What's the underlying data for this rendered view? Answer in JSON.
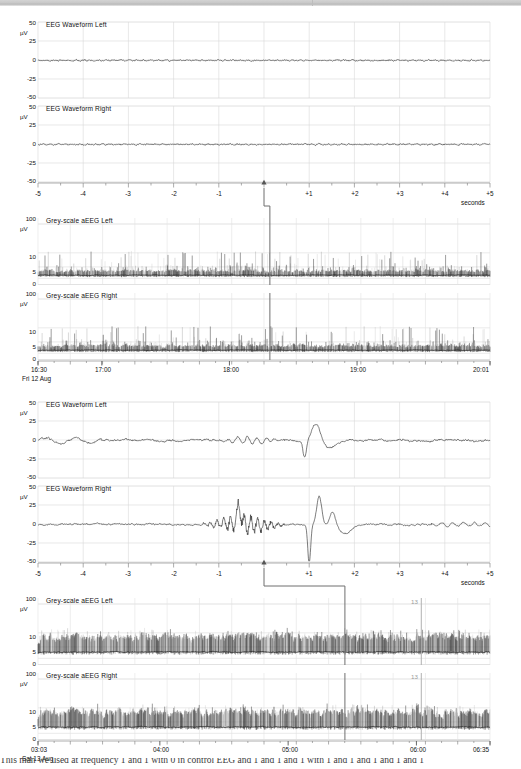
{
  "meta": {
    "units_label": "µV",
    "seconds_label": "seconds",
    "grid_color": "#d8d8d8",
    "axis_color": "#8a8a8a",
    "trace_color": "#2b2b2b",
    "marker_color": "#6e6e6e",
    "annotation_color": "#9b9b9b"
  },
  "caption": {
    "text": "This man we used at frequency 1 and 1 with 0 in control EEG and 1 and 1 and 1 with 1 and 1 and 1 and 1 and 1"
  },
  "panels": [
    {
      "id": "panel-top",
      "eeg": [
        {
          "title": "EEG Waveform Left",
          "y_ticks": [
            "50",
            "25",
            "0",
            "-25",
            "-50"
          ],
          "y_values": [
            50,
            25,
            0,
            -25,
            -50
          ],
          "unit": "µV"
        },
        {
          "title": "EEG Waveform Right",
          "y_ticks": [
            "50",
            "25",
            "0",
            "-25",
            "-50"
          ],
          "y_values": [
            50,
            25,
            0,
            -25,
            -50
          ],
          "unit": "µV"
        }
      ],
      "eeg_x_ticks": [
        "-5",
        "-4",
        "-3",
        "-2",
        "-1",
        "",
        "+1",
        "+2",
        "+3",
        "+4",
        "+5"
      ],
      "eeg_x_unit": "seconds",
      "eeg_marker_seconds": 0,
      "aeeg": [
        {
          "title": "Grey-scale aEEG Left",
          "y_ticks": [
            "100",
            "10",
            "5",
            "0"
          ],
          "unit": "µV"
        },
        {
          "title": "Grey-scale aEEG Right",
          "y_ticks": [
            "100",
            "10",
            "5",
            "0"
          ],
          "unit": "µV"
        }
      ],
      "aeeg_x_ticks": [
        "16:30",
        "17:00",
        "18:00",
        "19:00",
        "20:01"
      ],
      "aeeg_x_positions": [
        0.0,
        0.1412,
        0.4235,
        0.7059,
        1.0
      ],
      "aeeg_date": "Fri 12 Aug",
      "aeeg_cursor_fraction": 0.513,
      "aeeg_annotations": []
    },
    {
      "id": "panel-bottom",
      "eeg": [
        {
          "title": "EEG Waveform Left",
          "y_ticks": [
            "50",
            "25",
            "0",
            "-25",
            "-50"
          ],
          "y_values": [
            50,
            25,
            0,
            -25,
            -50
          ],
          "unit": "µV"
        },
        {
          "title": "EEG Waveform Right",
          "y_ticks": [
            "50",
            "25",
            "0",
            "-25",
            "-50"
          ],
          "y_values": [
            50,
            25,
            0,
            -25,
            -50
          ],
          "unit": "µV"
        }
      ],
      "eeg_x_ticks": [
        "-5",
        "-4",
        "-3",
        "-2",
        "-1",
        "",
        "+1",
        "+2",
        "+3",
        "+4",
        "+5"
      ],
      "eeg_x_unit": "seconds",
      "eeg_marker_seconds": 0,
      "aeeg": [
        {
          "title": "Grey-scale aEEG Left",
          "y_ticks": [
            "100",
            "10",
            "5",
            "0"
          ],
          "unit": "µV"
        },
        {
          "title": "Grey-scale aEEG Right",
          "y_ticks": [
            "100",
            "10",
            "5",
            "0"
          ],
          "unit": "µV"
        }
      ],
      "aeeg_x_ticks": [
        "03:03",
        "04:00",
        "05:00",
        "06:00",
        "06:35"
      ],
      "aeeg_x_positions": [
        0.0,
        0.2696,
        0.5534,
        0.8372,
        1.0
      ],
      "aeeg_date": "Sat 13 Aug",
      "aeeg_cursor_fraction": 0.679,
      "aeeg_annotations": [
        {
          "label": "13",
          "fraction": 0.848
        }
      ]
    }
  ],
  "chart_data": {
    "type": "line",
    "panels": [
      {
        "name": "Event 1 (Fri 12 Aug, cursor ~18:20)",
        "eeg_epoch": {
          "xlabel": "seconds",
          "ylabel": "µV",
          "xlim": [
            -5,
            5
          ],
          "ylim": [
            -50,
            50
          ],
          "yticks": [
            -50,
            -25,
            0,
            25,
            50
          ],
          "xticks": [
            -5,
            -4,
            -3,
            -2,
            -1,
            0,
            1,
            2,
            3,
            4,
            5
          ],
          "grid": true,
          "marker_x": 0,
          "series": [
            {
              "name": "EEG Waveform Left",
              "amplitude_uV_rms": 1.5,
              "description": "near-flat low-voltage trace, tiny ripple about 0 µV"
            },
            {
              "name": "EEG Waveform Right",
              "amplitude_uV_rms": 2.0,
              "description": "low-voltage fast ripple about 0 µV"
            }
          ]
        },
        "aeeg_trend": {
          "xlabel": "clock time",
          "ylabel": "µV",
          "yticks": [
            0,
            5,
            10,
            100
          ],
          "yscale": "semi-log",
          "x_start": "16:30",
          "x_end": "20:01",
          "xticks": [
            "16:30",
            "17:00",
            "18:00",
            "19:00",
            "20:01"
          ],
          "date": "Fri 12 Aug",
          "cursor_fraction": 0.513,
          "series": [
            {
              "name": "Grey-scale aEEG Left",
              "lower_margin_uV": 1.0,
              "upper_margin_uV": 4.0,
              "burst_peak_uV": 12,
              "description": "discontinuous low-voltage background, dense spiky bursts"
            },
            {
              "name": "Grey-scale aEEG Right",
              "lower_margin_uV": 1.0,
              "upper_margin_uV": 4.5,
              "burst_peak_uV": 13,
              "description": "discontinuous low-voltage background, dense spiky bursts"
            }
          ]
        }
      },
      {
        "name": "Event 2 (Sat 13 Aug, cursor ~05:25)",
        "eeg_epoch": {
          "xlabel": "seconds",
          "ylabel": "µV",
          "xlim": [
            -5,
            5
          ],
          "ylim": [
            -50,
            50
          ],
          "yticks": [
            -50,
            -25,
            0,
            25,
            50
          ],
          "xticks": [
            -5,
            -4,
            -3,
            -2,
            -1,
            0,
            1,
            2,
            3,
            4,
            5
          ],
          "grid": true,
          "marker_x": 0,
          "series": [
            {
              "name": "EEG Waveform Left",
              "amplitude_uV_rms": 6,
              "peak_uV": 23,
              "trough_uV": -27,
              "description": "rhythmic mid-voltage activity -1 to 0 s, large sharp transient peaking +23 µV at +1.1 s"
            },
            {
              "name": "EEG Waveform Right",
              "amplitude_uV_rms": 9,
              "peak_uV": 38,
              "trough_uV": -52,
              "description": "sharp spike-and-wave burst from -1.3 s, maximal deflection -52 µV at +1.0 s"
            }
          ]
        },
        "aeeg_trend": {
          "xlabel": "clock time",
          "ylabel": "µV",
          "yticks": [
            0,
            5,
            10,
            100
          ],
          "yscale": "semi-log",
          "x_start": "03:03",
          "x_end": "06:35",
          "xticks": [
            "03:03",
            "04:00",
            "05:00",
            "06:00",
            "06:35"
          ],
          "date": "Sat 13 Aug",
          "cursor_fraction": 0.679,
          "annotations": [
            {
              "label": "13",
              "fraction": 0.848
            }
          ],
          "series": [
            {
              "name": "Grey-scale aEEG Left",
              "lower_margin_uV": 2.0,
              "upper_margin_uV": 11.0,
              "burst_peak_uV": 15,
              "description": "continuous higher-voltage band, saw-tooth margins 2–11 µV"
            },
            {
              "name": "Grey-scale aEEG Right",
              "lower_margin_uV": 2.0,
              "upper_margin_uV": 11.5,
              "burst_peak_uV": 16,
              "description": "continuous higher-voltage band, saw-tooth margins 2–11 µV"
            }
          ]
        }
      }
    ]
  }
}
